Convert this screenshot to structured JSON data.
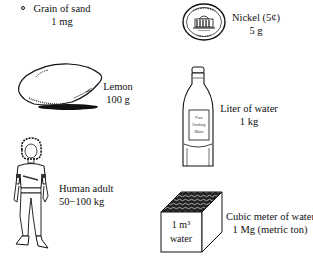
{
  "items": [
    {
      "id": "sand",
      "name": "Grain of sand",
      "mass": "1 mg",
      "icon": "sand-grain-icon"
    },
    {
      "id": "nickel",
      "name": "Nickel (5¢)",
      "mass": "5 g",
      "icon": "nickel-coin-icon"
    },
    {
      "id": "lemon",
      "name": "Lemon",
      "mass": "100 g",
      "icon": "lemon-icon"
    },
    {
      "id": "water-liter",
      "name": "Liter of water",
      "mass": "1 kg",
      "icon": "water-bottle-icon",
      "bottle_label": [
        "Pure",
        "Drinking",
        "Water"
      ]
    },
    {
      "id": "human",
      "name": "Human adult",
      "mass": "50−100 kg",
      "icon": "human-figure-icon"
    },
    {
      "id": "water-cube",
      "name": "Cubic meter of water",
      "mass": "1 Mg (metric ton)",
      "icon": "water-cube-icon",
      "cube_label": [
        "1 m³",
        "water"
      ]
    }
  ],
  "colors": {
    "ink": "#111111",
    "background": "#ffffff"
  }
}
